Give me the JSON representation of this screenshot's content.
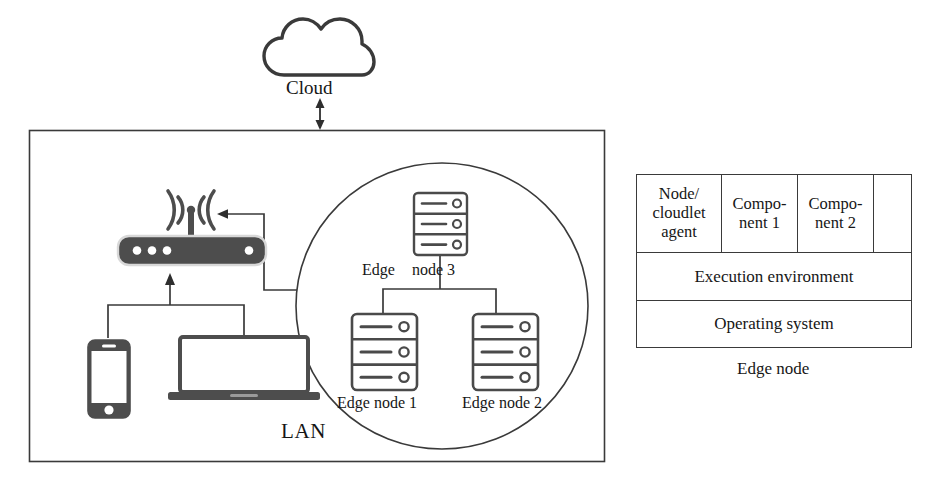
{
  "diagram": {
    "cloud_label": "Cloud",
    "lan_label": "LAN",
    "edge_node_3_label_part1": "Edge",
    "edge_node_3_label_part2": "node 3",
    "edge_node_1_label": "Edge node 1",
    "edge_node_2_label": "Edge node 2",
    "stack_caption": "Edge node"
  },
  "stack_table": {
    "rows": [
      {
        "cells": [
          {
            "text": "Node/\ncloudlet\nagent",
            "lines": [
              "Node/",
              "cloudlet",
              "agent"
            ]
          },
          {
            "text": "Compo-\nnent 1",
            "lines": [
              "Compo-",
              "nent 1"
            ]
          },
          {
            "text": "Compo-\nnent 2",
            "lines": [
              "Compo-",
              "nent 2"
            ]
          },
          {
            "text": "",
            "lines": []
          }
        ]
      },
      {
        "cells": [
          {
            "text": "Execution environment",
            "lines": [
              "Execution environment"
            ]
          }
        ]
      },
      {
        "cells": [
          {
            "text": "Operating system",
            "lines": [
              "Operating system"
            ]
          }
        ]
      }
    ],
    "agent_line_1": "Node/",
    "agent_line_2": "cloudlet",
    "agent_line_3": "agent",
    "component1_line_1": "Compo-",
    "component1_line_2": "nent 1",
    "component2_line_1": "Compo-",
    "component2_line_2": "nent 2",
    "blank_cell": "",
    "execution_environment": "Execution environment",
    "operating_system": "Operating system"
  },
  "icons": {
    "cloud": "cloud-icon",
    "router": "wifi-router-icon",
    "smartphone": "smartphone-icon",
    "laptop": "laptop-icon",
    "server_rack": "server-rack-icon",
    "arrow_bidirectional": "bidirectional-arrow-icon",
    "arrow_left": "arrow-left-icon",
    "arrow_up": "arrow-up-icon"
  },
  "colors": {
    "stroke": "#3a3a3a",
    "device_fill": "#4a4a4a",
    "background": "#ffffff",
    "text": "#161616"
  }
}
